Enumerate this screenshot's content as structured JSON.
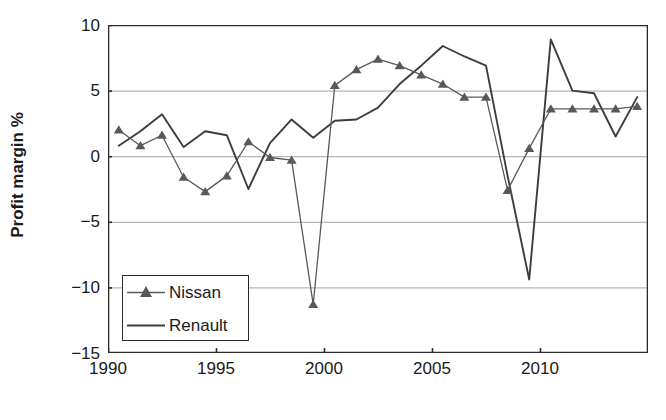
{
  "chart_data": {
    "type": "line",
    "title": "",
    "xlabel": "",
    "ylabel": "Profit margin %",
    "xlim": [
      1990,
      2015
    ],
    "ylim": [
      -15,
      10
    ],
    "ytick_values": [
      10,
      5,
      0,
      -5,
      -10,
      -15
    ],
    "ytick_labels": [
      "10",
      "5",
      "0",
      "−5",
      "−10",
      "−15"
    ],
    "xtick_values": [
      1990,
      1995,
      2000,
      2005,
      2010
    ],
    "xtick_labels": [
      "1990",
      "1995",
      "2000",
      "2005",
      "2010"
    ],
    "grid": "horizontal",
    "legend_position": "lower left inside axes",
    "series": [
      {
        "name": "Nissan",
        "marker": "triangle",
        "color": "#595959",
        "x": [
          1990.5,
          1991.5,
          1992.5,
          1993.5,
          1994.5,
          1995.5,
          1996.5,
          1997.5,
          1998.5,
          1999.5,
          2000.5,
          2001.5,
          2002.5,
          2003.5,
          2004.5,
          2005.5,
          2006.5,
          2007.5,
          2008.5,
          2009.5,
          2010.5,
          2011.5,
          2012.5,
          2013.5,
          2014.5
        ],
        "values": [
          2.0,
          0.8,
          1.6,
          -1.6,
          -2.7,
          -1.5,
          1.1,
          -0.1,
          -0.3,
          -11.3,
          5.4,
          6.6,
          7.4,
          6.9,
          6.2,
          5.5,
          4.5,
          4.5,
          -2.6,
          0.6,
          3.6,
          3.6,
          3.6,
          3.6,
          3.8
        ]
      },
      {
        "name": "Renault",
        "marker": "none",
        "color": "#3d3d3d",
        "x": [
          1990.5,
          1991.5,
          1992.5,
          1993.5,
          1994.5,
          1995.5,
          1996.5,
          1997.5,
          1998.5,
          1999.5,
          2000.5,
          2001.5,
          2002.5,
          2003.5,
          2004.5,
          2005.5,
          2006.5,
          2007.5,
          2008.5,
          2009.5,
          2010.5,
          2011.5,
          2012.5,
          2013.5,
          2014.5
        ],
        "values": [
          0.8,
          1.9,
          3.2,
          0.7,
          1.9,
          1.6,
          -2.5,
          1.0,
          2.8,
          1.4,
          2.7,
          2.8,
          3.7,
          5.5,
          6.9,
          8.4,
          7.6,
          6.9,
          -1.5,
          -9.4,
          8.9,
          5.0,
          4.8,
          1.5,
          4.5
        ]
      }
    ]
  },
  "axes": {
    "ylabel": "Profit margin %"
  },
  "legend": {
    "entries": [
      {
        "label": "Nissan"
      },
      {
        "label": "Renault"
      }
    ]
  }
}
